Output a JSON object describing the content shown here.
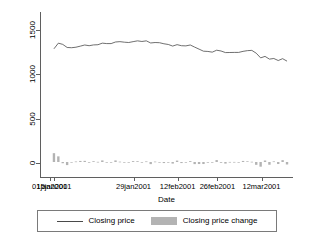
{
  "chart_data": {
    "type": "line",
    "title": "",
    "xlabel": "Date",
    "ylabel": "",
    "grid": false,
    "legend_position": "bottom",
    "ylim": [
      -170,
      1700
    ],
    "yticks": [
      0,
      500,
      1000,
      1500
    ],
    "ytick_labels": [
      "0",
      "500",
      "1000",
      "1500"
    ],
    "xlim": [
      "01jan2001",
      "20mar2001"
    ],
    "xticks": [
      "01jan2001",
      "15jan2001",
      "29jan2001",
      "12feb2001",
      "26feb2001",
      "12mar2001"
    ],
    "xtick_labels": [
      "01jan2001",
      "15jan2001",
      "29jan2001",
      "12feb2001",
      "26feb2001",
      "12mar2001"
    ],
    "series": [
      {
        "name": "Closing price",
        "type": "line",
        "color": "#4a4a4a",
        "x": [
          "02jan2001",
          "03jan2001",
          "04jan2001",
          "05jan2001",
          "08jan2001",
          "09jan2001",
          "10jan2001",
          "11jan2001",
          "12jan2001",
          "16jan2001",
          "17jan2001",
          "18jan2001",
          "19jan2001",
          "22jan2001",
          "23jan2001",
          "24jan2001",
          "25jan2001",
          "26jan2001",
          "29jan2001",
          "30jan2001",
          "31jan2001",
          "01feb2001",
          "02feb2001",
          "05feb2001",
          "06feb2001",
          "07feb2001",
          "08feb2001",
          "09feb2001",
          "12feb2001",
          "13feb2001",
          "14feb2001",
          "15feb2001",
          "16feb2001",
          "20feb2001",
          "21feb2001",
          "22feb2001",
          "23feb2001",
          "26feb2001",
          "27feb2001",
          "28feb2001",
          "01mar2001",
          "02mar2001",
          "05mar2001",
          "06mar2001",
          "07mar2001",
          "08mar2001",
          "09mar2001",
          "12mar2001",
          "13mar2001",
          "14mar2001",
          "15mar2001",
          "16mar2001",
          "19mar2001",
          "20mar2001"
        ],
        "values": [
          1283,
          1347,
          1333,
          1298,
          1295,
          1301,
          1313,
          1326,
          1318,
          1327,
          1329,
          1347,
          1342,
          1342,
          1360,
          1364,
          1358,
          1354,
          1364,
          1373,
          1366,
          1373,
          1349,
          1354,
          1352,
          1340,
          1332,
          1314,
          1330,
          1318,
          1316,
          1326,
          1302,
          1279,
          1256,
          1253,
          1245,
          1267,
          1258,
          1240,
          1241,
          1242,
          1242,
          1254,
          1262,
          1265,
          1233,
          1180,
          1197,
          1166,
          1173,
          1150,
          1171,
          1143
        ]
      },
      {
        "name": "Closing price change",
        "type": "bar",
        "color": "#b3b3b3",
        "x": [
          "02jan2001",
          "03jan2001",
          "04jan2001",
          "05jan2001",
          "08jan2001",
          "09jan2001",
          "10jan2001",
          "11jan2001",
          "12jan2001",
          "16jan2001",
          "17jan2001",
          "18jan2001",
          "19jan2001",
          "22jan2001",
          "23jan2001",
          "24jan2001",
          "25jan2001",
          "26jan2001",
          "29jan2001",
          "30jan2001",
          "31jan2001",
          "01feb2001",
          "02feb2001",
          "05feb2001",
          "06feb2001",
          "07feb2001",
          "08feb2001",
          "09feb2001",
          "12feb2001",
          "13feb2001",
          "14feb2001",
          "15feb2001",
          "16feb2001",
          "20feb2001",
          "21feb2001",
          "22feb2001",
          "23feb2001",
          "26feb2001",
          "27feb2001",
          "28feb2001",
          "01mar2001",
          "02mar2001",
          "05mar2001",
          "06mar2001",
          "07mar2001",
          "08mar2001",
          "09mar2001",
          "12mar2001",
          "13mar2001",
          "14mar2001",
          "15mar2001",
          "16mar2001",
          "19mar2001",
          "20mar2001"
        ],
        "values": [
          100,
          64,
          -14,
          -35,
          -3,
          6,
          12,
          13,
          -8,
          9,
          2,
          18,
          -5,
          0,
          18,
          4,
          -6,
          -4,
          10,
          9,
          -7,
          7,
          -24,
          5,
          -2,
          -12,
          -8,
          -18,
          16,
          -12,
          -2,
          10,
          -24,
          -23,
          -23,
          -3,
          -8,
          22,
          -9,
          -18,
          1,
          1,
          0,
          12,
          8,
          3,
          -32,
          -53,
          17,
          -31,
          7,
          -23,
          21,
          -28
        ]
      }
    ]
  },
  "axis": {
    "x_title": "Date"
  },
  "legend": {
    "entries": [
      {
        "label": "Closing price",
        "marker": "line-key",
        "color": "#4a4a4a"
      },
      {
        "label": "Closing price change",
        "marker": "swatch-key",
        "color": "#b3b3b3"
      }
    ]
  }
}
